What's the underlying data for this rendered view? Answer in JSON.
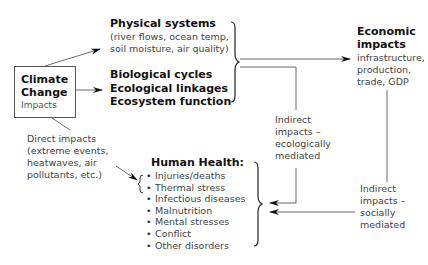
{
  "climate_change": {
    "title_line1": "Climate",
    "title_line2": "Change",
    "subtitle": "Impacts"
  },
  "physical_systems": {
    "title": "Physical systems",
    "detail_line1": "(river flows, ocean temp,",
    "detail_line2": "soil moisture, air quality)"
  },
  "biological": {
    "line1": "Biological cycles",
    "line2": "Ecological linkages",
    "line3": "Ecosystem function"
  },
  "economic_impacts": {
    "title_line1": "Economic",
    "title_line2": "impacts",
    "detail_line1": "infrastructure,",
    "detail_line2": "production,",
    "detail_line3": "trade, GDP"
  },
  "indirect_ecological": {
    "line1": "Indirect",
    "line2": "impacts –",
    "line3": "ecologically",
    "line4": "mediated"
  },
  "indirect_social": {
    "line1": "Indirect",
    "line2": "impacts –",
    "line3": "socially",
    "line4": "mediated"
  },
  "direct_impacts": {
    "line1": "Direct impacts",
    "line2": "(extreme events,",
    "line3": "heatwaves, air",
    "line4": "pollutants, etc.)"
  },
  "human_health": {
    "title": "Human Health:",
    "items": [
      "Injuries/deaths",
      "Thermal stress",
      "Infectious diseases",
      "Malnutrition",
      "Mental stresses",
      "Conflict",
      "Other disorders"
    ]
  }
}
